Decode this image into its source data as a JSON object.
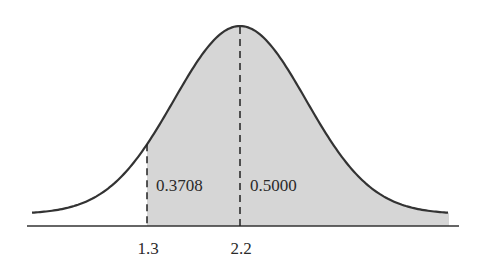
{
  "chart_data": {
    "type": "area",
    "title": "",
    "xlabel": "",
    "ylabel": "",
    "distribution": "normal",
    "mean": 2.2,
    "grid": false,
    "legend": null,
    "x_ticks": [
      {
        "value": 1.3,
        "label": "1.3"
      },
      {
        "value": 2.2,
        "label": "2.2"
      }
    ],
    "dashed_lines": [
      1.3,
      2.2
    ],
    "shaded_region": {
      "from": 1.3,
      "to": "+inf",
      "color": "#d6d6d6"
    },
    "annotations": [
      {
        "text": "0.3708",
        "region": "between 1.3 and 2.2"
      },
      {
        "text": "0.5000",
        "region": "right of 2.2"
      }
    ],
    "curve_color": "#333333",
    "axis_color": "#333333"
  },
  "labels": {
    "area_left": "0.3708",
    "area_right": "0.5000",
    "tick_1": "1.3",
    "tick_2": "2.2"
  }
}
